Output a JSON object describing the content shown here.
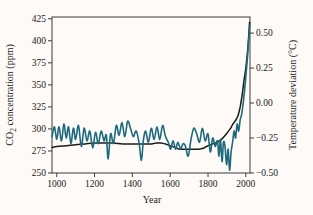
{
  "figure": {
    "background_color": "#fdfaf7",
    "axis_color": "#3c3c3c",
    "text_color": "#222222"
  },
  "chart_data": {
    "type": "line",
    "title": "",
    "xlabel": "Year",
    "ylabel_left": "CO₂ concentration (ppm)",
    "ylabel_left_parts": {
      "pre": "CO",
      "sub": "2",
      "post": " concentration (ppm)"
    },
    "ylabel_right": "Temperature deviation (°C)",
    "grid": false,
    "legend_position": "none",
    "x_range": [
      975,
      2022
    ],
    "x_ticks": [
      1000,
      1200,
      1400,
      1600,
      1800,
      2000
    ],
    "yleft_range": [
      250,
      427
    ],
    "yleft_ticks": [
      250,
      275,
      300,
      325,
      350,
      375,
      400,
      425
    ],
    "yright_range": [
      -0.5,
      0.615
    ],
    "yright_ticks": [
      0.5,
      0.25,
      0.0,
      -0.25,
      -0.5
    ],
    "yright_tick_labels": [
      "0.50",
      "0.25",
      "0.00",
      "−0.25",
      "−0.50"
    ],
    "series": [
      {
        "name": "CO2 concentration",
        "axis": "left",
        "color": "#1b1b1b",
        "width": 1.5,
        "x": [
          975,
          1000,
          1050,
          1100,
          1150,
          1200,
          1250,
          1300,
          1350,
          1400,
          1450,
          1500,
          1525,
          1550,
          1575,
          1600,
          1625,
          1650,
          1675,
          1700,
          1725,
          1750,
          1775,
          1800,
          1825,
          1850,
          1875,
          1900,
          1910,
          1920,
          1930,
          1940,
          1950,
          1960,
          1970,
          1980,
          1990,
          2000,
          2010,
          2020
        ],
        "y": [
          279,
          280,
          281,
          282,
          283,
          284,
          284,
          284,
          283,
          283,
          283,
          283,
          284,
          284,
          283,
          281,
          279,
          277,
          277,
          277,
          277,
          277,
          278,
          281,
          283,
          285,
          289,
          295,
          298,
          301,
          305,
          308,
          311,
          316,
          325,
          338,
          354,
          369,
          390,
          421
        ]
      },
      {
        "name": "Temperature deviation",
        "axis": "right",
        "color": "#1e6a7d",
        "width": 1.6,
        "x": [
          975,
          988,
          1000,
          1012,
          1025,
          1038,
          1050,
          1062,
          1075,
          1088,
          1100,
          1115,
          1130,
          1145,
          1160,
          1175,
          1190,
          1205,
          1220,
          1235,
          1250,
          1262,
          1272,
          1285,
          1300,
          1315,
          1330,
          1345,
          1360,
          1375,
          1390,
          1405,
          1420,
          1435,
          1448,
          1458,
          1470,
          1485,
          1500,
          1515,
          1530,
          1545,
          1560,
          1575,
          1590,
          1602,
          1615,
          1628,
          1641,
          1655,
          1668,
          1681,
          1695,
          1710,
          1725,
          1740,
          1755,
          1770,
          1785,
          1800,
          1812,
          1825,
          1838,
          1850,
          1858,
          1866,
          1874,
          1882,
          1890,
          1898,
          1906,
          1914,
          1922,
          1930,
          1938,
          1946,
          1954,
          1962,
          1970,
          1978,
          1986,
          1994,
          2002,
          2010,
          2016,
          2020
        ],
        "y": [
          -0.24,
          -0.17,
          -0.26,
          -0.17,
          -0.27,
          -0.15,
          -0.25,
          -0.17,
          -0.29,
          -0.18,
          -0.26,
          -0.16,
          -0.31,
          -0.18,
          -0.27,
          -0.2,
          -0.32,
          -0.21,
          -0.29,
          -0.2,
          -0.27,
          -0.23,
          -0.4,
          -0.22,
          -0.29,
          -0.16,
          -0.23,
          -0.14,
          -0.24,
          -0.13,
          -0.18,
          -0.24,
          -0.2,
          -0.28,
          -0.41,
          -0.27,
          -0.2,
          -0.28,
          -0.18,
          -0.26,
          -0.17,
          -0.26,
          -0.16,
          -0.24,
          -0.28,
          -0.33,
          -0.27,
          -0.33,
          -0.28,
          -0.33,
          -0.29,
          -0.31,
          -0.38,
          -0.26,
          -0.18,
          -0.22,
          -0.28,
          -0.18,
          -0.27,
          -0.22,
          -0.35,
          -0.25,
          -0.31,
          -0.27,
          -0.38,
          -0.26,
          -0.42,
          -0.28,
          -0.31,
          -0.44,
          -0.33,
          -0.48,
          -0.35,
          -0.28,
          -0.2,
          -0.25,
          -0.15,
          -0.2,
          -0.12,
          -0.08,
          0.0,
          0.1,
          0.22,
          0.35,
          0.47,
          0.55
        ]
      }
    ]
  }
}
